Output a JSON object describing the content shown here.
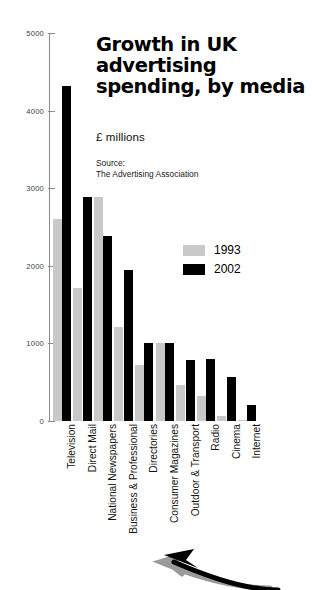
{
  "title": "Growth in UK\nadvertising\nspending, by media",
  "units_label": "£ millions",
  "source": "Source:\nThe Advertising Association",
  "legend": [
    {
      "label": "1993",
      "color": "#c9c9c9",
      "key": "1993"
    },
    {
      "label": "2002",
      "color": "#000000",
      "key": "2002"
    }
  ],
  "axis": {
    "tick_labels": [
      "0",
      "1000",
      "2000",
      "3000",
      "4000",
      "5000"
    ],
    "tick_values": [
      0,
      1000,
      2000,
      3000,
      4000,
      5000
    ]
  },
  "decoration": {
    "arrow_icon": "curved-arrow-icon"
  },
  "chart_data": {
    "type": "bar",
    "title": "Growth in UK advertising spending, by media",
    "subtitle": "£ millions",
    "source": "The Advertising Association",
    "xlabel": "",
    "ylabel": "£ millions",
    "ylim": [
      0,
      5000
    ],
    "yticks": [
      0,
      1000,
      2000,
      3000,
      4000,
      5000
    ],
    "grid": false,
    "legend_position": "inside-upper-right",
    "categories": [
      "Television",
      "Direct Mail",
      "National Newspapers",
      "Business & Professional",
      "Directories",
      "Consumer Magazines",
      "Outdoor & Transport",
      "Radio",
      "Cinema",
      "Internet"
    ],
    "series": [
      {
        "name": "1993",
        "color": "#c9c9c9",
        "values": [
          2600,
          1720,
          2890,
          1210,
          720,
          1000,
          470,
          320,
          60,
          10
        ]
      },
      {
        "name": "2002",
        "color": "#000000",
        "values": [
          4320,
          2890,
          2380,
          1950,
          1000,
          1000,
          790,
          800,
          570,
          200
        ]
      }
    ]
  }
}
